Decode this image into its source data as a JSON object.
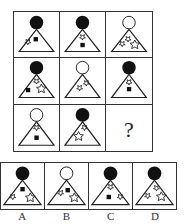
{
  "puzzle": {
    "question_mark": "?",
    "colors": {
      "line": "#222222",
      "fill_dark": "#111111",
      "background": "#ffffff"
    },
    "grid": [
      {
        "circle": "filled",
        "items": [
          "star-small",
          "square"
        ]
      },
      {
        "circle": "filled",
        "items": [
          "star-small",
          "square"
        ]
      },
      {
        "circle": "empty",
        "items": [
          "star-small",
          "star-small",
          "star"
        ]
      },
      {
        "circle": "filled",
        "items": [
          "square",
          "star-small",
          "star"
        ]
      },
      {
        "circle": "empty",
        "items": [
          "star-small",
          "star-small"
        ]
      },
      {
        "circle": "filled",
        "items": [
          "star-small",
          "square"
        ]
      },
      {
        "circle": "empty",
        "items": [
          "star-small",
          "square"
        ]
      },
      {
        "circle": "filled",
        "items": [
          "star-small",
          "star"
        ]
      },
      {
        "missing": true
      }
    ],
    "options": [
      {
        "label": "A",
        "circle": "filled",
        "items": [
          "square",
          "star-small",
          "star"
        ]
      },
      {
        "label": "B",
        "circle": "empty",
        "items": [
          "star-small",
          "square",
          "star"
        ]
      },
      {
        "label": "C",
        "circle": "filled",
        "items": [
          "star-small",
          "square",
          "star-small"
        ]
      },
      {
        "label": "D",
        "circle": "filled",
        "items": [
          "star-small",
          "star-small",
          "star"
        ]
      }
    ]
  }
}
